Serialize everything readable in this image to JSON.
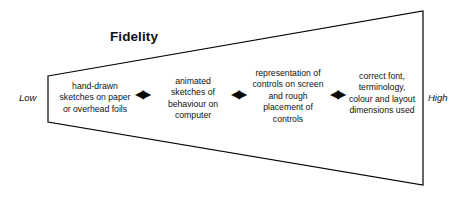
{
  "diagram": {
    "title": "Fidelity",
    "axis": {
      "low_label": "Low",
      "high_label": "High"
    },
    "arrow_glyph": "◀▶",
    "arrows": [
      {
        "name": "arrow-stage-1-to-2"
      },
      {
        "name": "arrow-stage-2-to-3"
      },
      {
        "name": "arrow-stage-3-to-4"
      }
    ],
    "shape": {
      "type": "funnel-trapezoid",
      "stroke_color": "#000000",
      "fill_color": "#ffffff",
      "stroke_width": 1.2,
      "points": "48,76 423,11 423,185 48,122"
    },
    "stages": [
      {
        "id": "stage-1",
        "lines": [
          "hand-drawn",
          "sketches on paper",
          "or overhead foils"
        ]
      },
      {
        "id": "stage-2",
        "lines": [
          "animated",
          "sketches of",
          "behaviour on",
          "computer"
        ]
      },
      {
        "id": "stage-3",
        "lines": [
          "representation of",
          "controls on screen",
          "and rough",
          "placement of",
          "controls"
        ]
      },
      {
        "id": "stage-4",
        "lines": [
          "correct font,",
          "terminology,",
          "colour and layout",
          "dimensions used"
        ]
      }
    ]
  }
}
